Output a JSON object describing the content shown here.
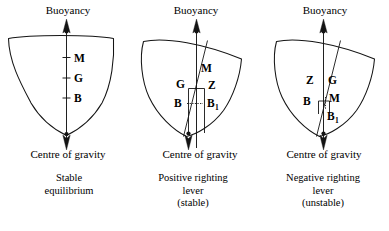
{
  "figure": {
    "background_color": "#ffffff",
    "ink_color": "#141414"
  },
  "panels": [
    {
      "id": "stable-equilibrium",
      "top_label": "Buoyancy",
      "bottom_label": "Centre of gravity",
      "caption_lines": [
        "Stable",
        "equilibrium"
      ],
      "heel": "upright",
      "points": [
        {
          "key": "M",
          "label": "M",
          "sub": "",
          "meaning": "metacentre"
        },
        {
          "key": "G",
          "label": "G",
          "sub": "",
          "meaning": "centre-of-gravity"
        },
        {
          "key": "B",
          "label": "B",
          "sub": "",
          "meaning": "centre-of-buoyancy"
        }
      ]
    },
    {
      "id": "positive-righting-lever",
      "top_label": "Buoyancy",
      "bottom_label": "Centre of gravity",
      "caption_lines": [
        "Positive righting",
        "lever",
        "(stable)"
      ],
      "heel": "heeled",
      "points": [
        {
          "key": "M",
          "label": "M",
          "sub": "",
          "meaning": "metacentre"
        },
        {
          "key": "G",
          "label": "G",
          "sub": "",
          "meaning": "centre-of-gravity"
        },
        {
          "key": "Z",
          "label": "Z",
          "sub": "",
          "meaning": "righting-lever-foot"
        },
        {
          "key": "B",
          "label": "B",
          "sub": "",
          "meaning": "centre-of-buoyancy"
        },
        {
          "key": "B1",
          "label": "B",
          "sub": "1",
          "meaning": "shifted-centre-of-buoyancy"
        }
      ]
    },
    {
      "id": "negative-righting-lever",
      "top_label": "Buoyancy",
      "bottom_label": "Centre of gravity",
      "caption_lines": [
        "Negative righting",
        "lever",
        "(unstable)"
      ],
      "heel": "heeled",
      "points": [
        {
          "key": "Z",
          "label": "Z",
          "sub": "",
          "meaning": "righting-lever-foot"
        },
        {
          "key": "G",
          "label": "G",
          "sub": "",
          "meaning": "centre-of-gravity"
        },
        {
          "key": "B",
          "label": "B",
          "sub": "",
          "meaning": "centre-of-buoyancy"
        },
        {
          "key": "M",
          "label": "M",
          "sub": "",
          "meaning": "metacentre"
        },
        {
          "key": "B1",
          "label": "B",
          "sub": "1",
          "meaning": "shifted-centre-of-buoyancy"
        }
      ]
    }
  ]
}
